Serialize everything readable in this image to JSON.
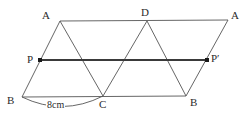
{
  "figure": {
    "type": "geometry-diagram",
    "width": 250,
    "height": 117,
    "background_color": "#ffffff",
    "line_color": "#555555",
    "bold_line_color": "#3a3a3a",
    "text_color": "#2b2b2b"
  },
  "labels": {
    "a_top_left": "A",
    "d_top_middle": "D",
    "a_top_right": "A",
    "p_left": "P",
    "p_prime_right": "P′",
    "b_bottom_left": "B",
    "c_bottom_middle": "C",
    "b_bottom_right": "B",
    "measure_bc": "8cm"
  },
  "points": {
    "a_top_left": {
      "x": 60,
      "y": 21
    },
    "d_top_middle": {
      "x": 147,
      "y": 21
    },
    "a_top_right": {
      "x": 228,
      "y": 20
    },
    "p_left": {
      "x": 40,
      "y": 60
    },
    "p_prime_right": {
      "x": 207,
      "y": 60
    },
    "b_bottom_left": {
      "x": 22,
      "y": 97
    },
    "c_bottom_middle": {
      "x": 103,
      "y": 96
    },
    "b_bottom_right": {
      "x": 186,
      "y": 96
    }
  },
  "segments": [
    {
      "name": "top-edge",
      "from": "a_top_left",
      "to": "a_top_right",
      "bold": false
    },
    {
      "name": "bottom-edge",
      "from": "b_bottom_left",
      "to": "b_bottom_right",
      "bold": false
    },
    {
      "name": "left-edge",
      "from": "a_top_left",
      "to": "b_bottom_left",
      "bold": false
    },
    {
      "name": "right-edge",
      "from": "a_top_right",
      "to": "b_bottom_right",
      "bold": false
    },
    {
      "name": "diagonal-a-to-c",
      "from": "a_top_left",
      "to": "c_bottom_middle",
      "bold": false
    },
    {
      "name": "diagonal-c-to-d",
      "from": "c_bottom_middle",
      "to": "d_top_middle",
      "bold": false
    },
    {
      "name": "diagonal-d-to-b",
      "from": "d_top_middle",
      "to": "b_bottom_right",
      "bold": false
    },
    {
      "name": "midline-p-to-pprime",
      "from": "p_left",
      "to": "p_prime_right",
      "bold": true
    }
  ],
  "arc": {
    "name": "measure-arc-bc",
    "from": "b_bottom_left",
    "to": "c_bottom_middle",
    "sag": 10
  },
  "markers": [
    {
      "name": "point-marker-p",
      "at": "p_left"
    },
    {
      "name": "point-marker-p-prime",
      "at": "p_prime_right"
    }
  ],
  "label_positions": {
    "a_top_left": {
      "left": 42,
      "top": 10
    },
    "d_top_middle": {
      "left": 141,
      "top": 7
    },
    "a_top_right": {
      "left": 231,
      "top": 10
    },
    "p_left": {
      "left": 27,
      "top": 54
    },
    "p_prime_right": {
      "left": 211,
      "top": 53
    },
    "b_bottom_left": {
      "left": 7,
      "top": 95
    },
    "c_bottom_middle": {
      "left": 99,
      "top": 99
    },
    "b_bottom_right": {
      "left": 190,
      "top": 97
    },
    "measure_bc": {
      "left": 46,
      "top": 100
    }
  }
}
